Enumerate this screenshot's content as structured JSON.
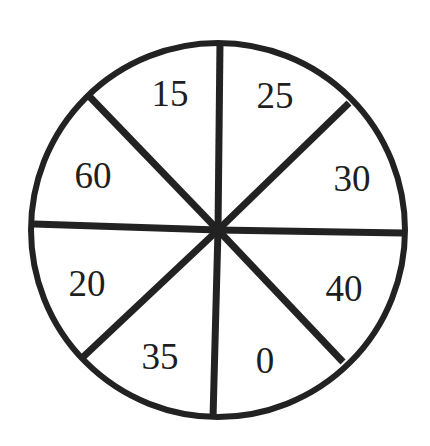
{
  "spinner": {
    "center": {
      "x": 218,
      "y": 230
    },
    "radius": 187,
    "stroke_color": "#222222",
    "stroke_width": 7,
    "outline_width": 6,
    "dividers": [
      {
        "name": "divider-top",
        "x1": 218,
        "y1": 230,
        "x2": 220,
        "y2": 42
      },
      {
        "name": "divider-upper-right",
        "x1": 218,
        "y1": 230,
        "x2": 349,
        "y2": 103
      },
      {
        "name": "divider-right",
        "x1": 218,
        "y1": 230,
        "x2": 403,
        "y2": 233
      },
      {
        "name": "divider-lower-right",
        "x1": 218,
        "y1": 230,
        "x2": 343,
        "y2": 362
      },
      {
        "name": "divider-bottom",
        "x1": 218,
        "y1": 230,
        "x2": 213,
        "y2": 418
      },
      {
        "name": "divider-lower-left",
        "x1": 218,
        "y1": 230,
        "x2": 82,
        "y2": 358
      },
      {
        "name": "divider-left",
        "x1": 218,
        "y1": 230,
        "x2": 34,
        "y2": 224
      },
      {
        "name": "divider-upper-left",
        "x1": 218,
        "y1": 230,
        "x2": 89,
        "y2": 96
      }
    ],
    "sectors": [
      {
        "label": "15",
        "x": 170,
        "y": 93
      },
      {
        "label": "25",
        "x": 275,
        "y": 95
      },
      {
        "label": "30",
        "x": 352,
        "y": 178
      },
      {
        "label": "40",
        "x": 344,
        "y": 288
      },
      {
        "label": "0",
        "x": 265,
        "y": 360
      },
      {
        "label": "35",
        "x": 160,
        "y": 356
      },
      {
        "label": "20",
        "x": 87,
        "y": 283
      },
      {
        "label": "60",
        "x": 93,
        "y": 175
      }
    ]
  }
}
